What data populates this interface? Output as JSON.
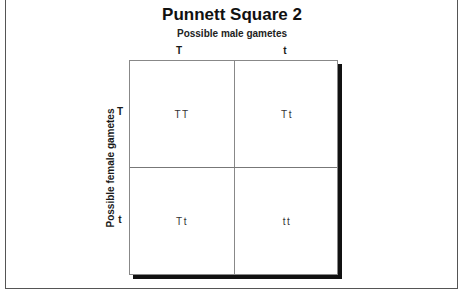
{
  "title": "Punnett Square 2",
  "subtitle": "Possible male gametes",
  "side_label": "Possible female gametes",
  "columns": [
    "T",
    "t"
  ],
  "rows": [
    "T",
    "t"
  ],
  "cells": [
    [
      "TT",
      "Tt"
    ],
    [
      "Tt",
      "tt"
    ]
  ]
}
